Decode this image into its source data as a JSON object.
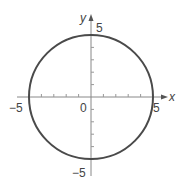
{
  "chart_data": {
    "type": "line",
    "title": "",
    "xlabel": "x",
    "ylabel": "y",
    "xlim": [
      -5,
      5
    ],
    "ylim": [
      -5,
      5
    ],
    "grid": false,
    "legend": "none",
    "x_tick_labels": [
      "-5",
      "0",
      "5"
    ],
    "y_tick_labels": [
      "5",
      "-5"
    ],
    "tick_interval": 1,
    "series": [
      {
        "name": "circle",
        "center": [
          0,
          0
        ],
        "radius": 5,
        "x": [
          5,
          4.33,
          2.5,
          0,
          -2.5,
          -4.33,
          -5,
          -4.33,
          -2.5,
          0,
          2.5,
          4.33,
          5
        ],
        "y": [
          0,
          2.5,
          4.33,
          5,
          4.33,
          2.5,
          0,
          -2.5,
          -4.33,
          -5,
          -4.33,
          -2.5,
          0
        ]
      }
    ],
    "annotations": {
      "origin_label": "0",
      "x_neg_label": "-5",
      "x_pos_label": "5",
      "y_pos_label": "5",
      "y_neg_label": "-5"
    }
  },
  "colors": {
    "curve": "#4a4a4a",
    "axis": "#777777",
    "text": "#444444"
  }
}
